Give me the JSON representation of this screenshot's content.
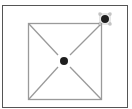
{
  "canvas": {
    "background": "#ffffff",
    "frame_color": "#555555",
    "shape_stroke": "#9a9a9a",
    "dot_color": "#1e1e1e",
    "handle_color": "#888888"
  },
  "diagram": {
    "shapes": [
      {
        "kind": "square",
        "name": "inner-square"
      },
      {
        "kind": "diagonal",
        "name": "diagonal-tl-br"
      },
      {
        "kind": "diagonal",
        "name": "diagonal-bl-tr"
      },
      {
        "kind": "point",
        "name": "center-point"
      },
      {
        "kind": "point",
        "name": "corner-control-point",
        "selected": true
      }
    ]
  }
}
